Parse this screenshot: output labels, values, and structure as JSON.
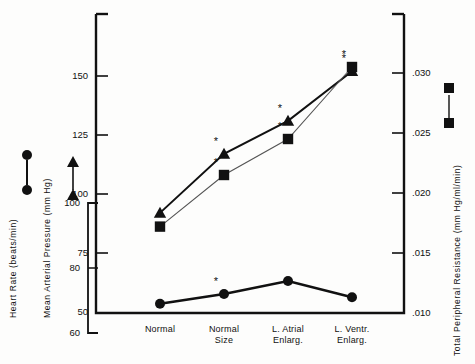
{
  "chart_data": {
    "type": "line",
    "title": "",
    "xlabel": "",
    "categories": [
      "Normal",
      "Normal Size",
      "L. Atrial Enlarg.",
      "L. Ventr. Enlarg."
    ],
    "category_lines": [
      [
        "Normal"
      ],
      [
        "Normal",
        "Size"
      ],
      [
        "L. Atrial",
        "Enlarg."
      ],
      [
        "L. Ventr.",
        "Enlarg."
      ]
    ],
    "grid": false,
    "legend_position": "left-axis-inline",
    "series": [
      {
        "name": "Heart Rate",
        "marker": "circle",
        "axis": "left-outer",
        "units": "beats/min",
        "values": [
          69,
          72,
          76,
          71
        ],
        "significance": [
          false,
          true,
          false,
          false
        ]
      },
      {
        "name": "Mean Arterial Pressure",
        "marker": "triangle",
        "axis": "left-inner",
        "units": "mm Hg",
        "values": [
          92,
          117,
          131,
          152
        ],
        "significance": [
          false,
          true,
          true,
          true
        ]
      },
      {
        "name": "Total Peripheral Resistance",
        "marker": "square",
        "axis": "right",
        "units": "mm Hg/ml/min",
        "values": [
          0.0172,
          0.0215,
          0.0245,
          0.0305
        ],
        "significance": [
          false,
          true,
          true,
          true
        ]
      }
    ],
    "axes": {
      "heart_rate": {
        "label": "Heart Rate (beats/min)",
        "ticks": [
          "60",
          "80",
          "100"
        ],
        "tick_values": [
          60,
          80,
          100
        ],
        "range": [
          60,
          103
        ]
      },
      "mean_arterial_pressure": {
        "label": "Mean Arterial Pressure (mm Hg)",
        "ticks": [
          "50",
          "75",
          "100",
          "125",
          "150"
        ],
        "tick_values": [
          50,
          75,
          100,
          125,
          150
        ],
        "range": [
          50,
          162
        ]
      },
      "total_peripheral_resistance": {
        "label": "Total Peripheral Resistance (mm Hg/ml/min)",
        "ticks": [
          ".010",
          ".015",
          ".020",
          ".025",
          ".030"
        ],
        "tick_values": [
          0.01,
          0.015,
          0.02,
          0.025,
          0.03
        ],
        "range": [
          0.01,
          0.0335
        ]
      }
    },
    "annotations": {
      "significance_symbol": "*"
    },
    "colors": {
      "ink": "#111111",
      "background": "#fdfdfc",
      "line_map": "#111111",
      "line_tpr": "#555555",
      "line_hr": "#111111"
    }
  }
}
